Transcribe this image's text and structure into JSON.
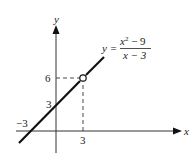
{
  "figure": {
    "axes": {
      "x_label": "x",
      "y_label": "y",
      "x_ticks": [
        {
          "value": -3,
          "label": "−3"
        },
        {
          "value": 3,
          "label": "3"
        }
      ],
      "y_ticks": [
        {
          "value": 3,
          "label": "3"
        },
        {
          "value": 6,
          "label": "6"
        }
      ]
    },
    "equation": {
      "lhs": "y =",
      "numerator": "x² − 9",
      "numerator_base": "x",
      "numerator_exp": "2",
      "numerator_rest": " − 9",
      "denominator": "x − 3"
    },
    "line": {
      "slope": 1,
      "intercept": 3,
      "description": "y = x + 3 with hole at x = 3"
    },
    "hole": {
      "x": 3,
      "y": 6
    }
  }
}
